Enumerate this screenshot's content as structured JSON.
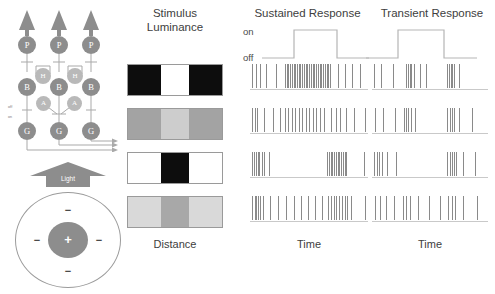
{
  "figure": {
    "columns": {
      "stimulus_title_line1": "Stimulus",
      "stimulus_title_line2": "Luminance",
      "sustained_title": "Sustained Response",
      "transient_title": "Transient Response"
    },
    "axis_labels": {
      "stimulus_x": "Distance",
      "sustained_x": "Time",
      "transient_x": "Time"
    },
    "step_labels": {
      "on": "on",
      "off": "off"
    }
  },
  "retina_circuit": {
    "cells": [
      {
        "label": "P",
        "name": "photoreceptor-cell-left"
      },
      {
        "label": "P",
        "name": "photoreceptor-cell-center"
      },
      {
        "label": "P",
        "name": "photoreceptor-cell-right"
      },
      {
        "label": "H",
        "name": "horizontal-cell-left"
      },
      {
        "label": "H",
        "name": "horizontal-cell-right"
      },
      {
        "label": "B",
        "name": "bipolar-cell-left"
      },
      {
        "label": "B",
        "name": "bipolar-cell-center"
      },
      {
        "label": "B",
        "name": "bipolar-cell-right"
      },
      {
        "label": "A",
        "name": "amacrine-cell-left"
      },
      {
        "label": "A",
        "name": "amacrine-cell-right"
      },
      {
        "label": "G",
        "name": "ganglion-cell-left"
      },
      {
        "label": "G",
        "name": "ganglion-cell-center"
      },
      {
        "label": "G",
        "name": "ganglion-cell-right"
      }
    ],
    "sublamina_labels": {
      "off": "off",
      "on": "on"
    },
    "light_arrow_label": "Light"
  },
  "receptive_field": {
    "center_sign": "+",
    "surround_signs": [
      "−",
      "−",
      "−",
      "−"
    ]
  },
  "chart_data": {
    "type": "raster",
    "xlabel_stimulus": "Distance",
    "xlabel_response": "Time",
    "step_trace": {
      "levels": [
        "off",
        "on"
      ],
      "on_start_fraction": 0.3,
      "on_end_fraction": 0.7
    },
    "stimulus_rows": [
      {
        "name": "dark-surround-bright-center",
        "surround_color": "#0d0d0d",
        "center_color": "#ffffff",
        "surround_luminance": 5,
        "center_luminance": 100
      },
      {
        "name": "mid-surround-light-center",
        "surround_color": "#a3a3a3",
        "center_color": "#cdcdcd",
        "surround_luminance": 64,
        "center_luminance": 80
      },
      {
        "name": "bright-surround-dark-center",
        "surround_color": "#ffffff",
        "center_color": "#0d0d0d",
        "surround_luminance": 100,
        "center_luminance": 5
      },
      {
        "name": "light-surround-mid-center",
        "surround_color": "#d9d9d9",
        "center_color": "#a8a8a8",
        "surround_luminance": 85,
        "center_luminance": 66
      }
    ],
    "sustained_rasters": [
      [
        0.02,
        0.05,
        0.09,
        0.14,
        0.22,
        0.3,
        0.315,
        0.33,
        0.345,
        0.36,
        0.375,
        0.39,
        0.405,
        0.42,
        0.435,
        0.45,
        0.465,
        0.48,
        0.495,
        0.51,
        0.525,
        0.54,
        0.555,
        0.57,
        0.585,
        0.6,
        0.615,
        0.63,
        0.645,
        0.66,
        0.675,
        0.69,
        0.76,
        0.82,
        0.88,
        0.95
      ],
      [
        0.02,
        0.04,
        0.06,
        0.12,
        0.2,
        0.26,
        0.3,
        0.33,
        0.36,
        0.39,
        0.42,
        0.45,
        0.48,
        0.51,
        0.54,
        0.57,
        0.6,
        0.64,
        0.7,
        0.74,
        0.78,
        0.83,
        0.9,
        0.99
      ],
      [
        0.02,
        0.035,
        0.05,
        0.065,
        0.08,
        0.1,
        0.12,
        0.16,
        0.66,
        0.68,
        0.695,
        0.71,
        0.725,
        0.74,
        0.755,
        0.77,
        0.785,
        0.8,
        0.815,
        0.83,
        0.98
      ],
      [
        0.02,
        0.04,
        0.055,
        0.07,
        0.09,
        0.11,
        0.17,
        0.24,
        0.31,
        0.38,
        0.44,
        0.5,
        0.56,
        0.62,
        0.67,
        0.7,
        0.72,
        0.745,
        0.77,
        0.79,
        0.815,
        0.84,
        0.87,
        0.99
      ]
    ],
    "transient_rasters": [
      [
        0.02,
        0.08,
        0.18,
        0.3,
        0.315,
        0.33,
        0.345,
        0.37,
        0.42,
        0.47,
        0.66,
        0.675,
        0.69,
        0.705,
        0.72,
        0.76
      ],
      [
        0.03,
        0.1,
        0.2,
        0.28,
        0.3,
        0.32,
        0.34,
        0.38,
        0.66,
        0.68,
        0.7,
        0.72,
        0.76,
        0.88
      ],
      [
        0.02,
        0.04,
        0.06,
        0.09,
        0.13,
        0.21,
        0.66,
        0.68,
        0.7,
        0.72,
        0.74,
        0.8,
        0.9
      ],
      [
        0.03,
        0.07,
        0.12,
        0.19,
        0.27,
        0.3,
        0.33,
        0.4,
        0.5,
        0.6,
        0.67,
        0.7,
        0.73,
        0.8,
        0.92
      ]
    ]
  }
}
